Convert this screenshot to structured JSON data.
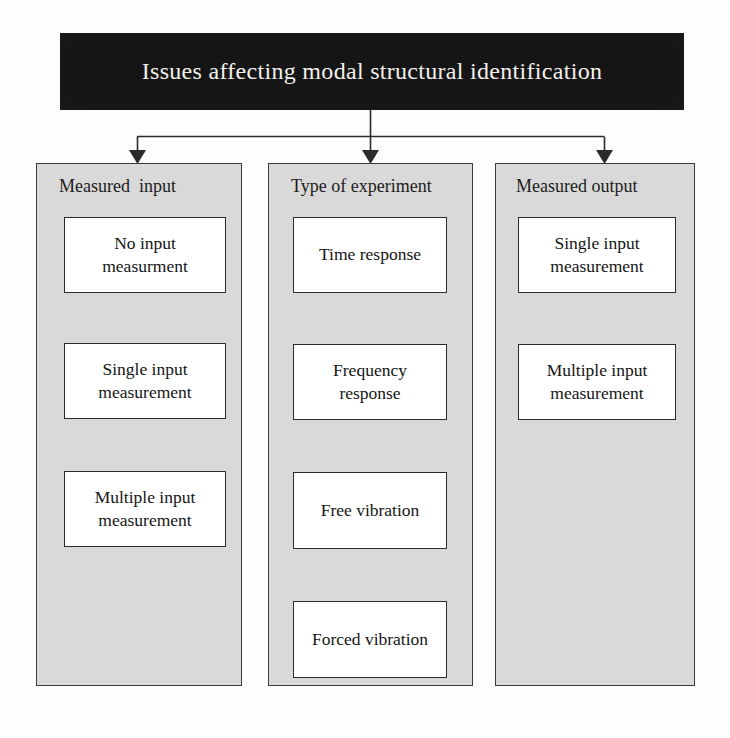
{
  "diagram": {
    "title": "Issues affecting modal structural identification",
    "columns": [
      {
        "header": "Measured  input",
        "nodes": [
          "No input\nmeasurment",
          "Single input\nmeasurement",
          "Multiple input\nmeasurement"
        ]
      },
      {
        "header": "Type of experiment",
        "nodes": [
          "Time response",
          "Frequency\nresponse",
          "Free vibration",
          "Forced vibration"
        ]
      },
      {
        "header": "Measured output",
        "nodes": [
          "Single input\nmeasurement",
          "Multiple input\nmeasurement"
        ]
      }
    ],
    "colors": {
      "title_background": "#151515",
      "title_text": "#f2f0ec",
      "panel_background": "#d9d9d9",
      "panel_border": "#3b3b3b",
      "node_background": "#ffffff",
      "node_border": "#2b2b2b",
      "connector": "#2b2b2b",
      "page_background": "#fdfdfd"
    }
  }
}
